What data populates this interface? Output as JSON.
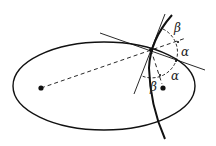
{
  "diagram": {
    "labels": {
      "beta_top": "β",
      "alpha_upper": "α",
      "alpha_lower": "α",
      "beta_bottom": "β"
    },
    "colors": {
      "stroke": "#111111",
      "background": "#ffffff"
    }
  }
}
